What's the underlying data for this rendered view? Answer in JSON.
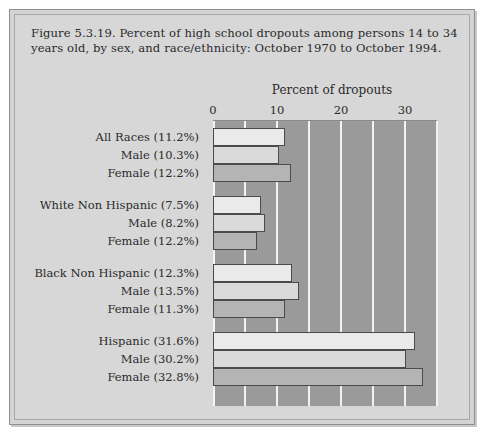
{
  "figure": {
    "caption": "Figure 5.3.19. Percent of high school dropouts among persons 14 to 34 years old, by sex, and race/ethnicity: October 1970 to October 1994."
  },
  "colors": {
    "page_background": "#ffffff",
    "panel_background": "#d7d7d7",
    "plot_background": "#9a9a9a",
    "gridline": "#f2f2f2",
    "bar_total": "#eaeaea",
    "bar_male": "#dadada",
    "bar_female": "#b4b4b4",
    "bar_outline": "#4b4b4b",
    "text": "#2a2a2a"
  },
  "chart_data": {
    "type": "bar",
    "orientation": "horizontal",
    "title": "Figure 5.3.19. Percent of high school dropouts among persons 14 to 34 years old, by sex, and race/ethnicity: October 1970 to October 1994.",
    "xlabel": "Percent of dropouts",
    "ylabel": "",
    "xlim": [
      0,
      35
    ],
    "xticks": [
      0,
      10,
      20,
      30
    ],
    "xtick_labels": [
      "0",
      "10",
      "20",
      "30"
    ],
    "minor_xticks": [
      5,
      15,
      25,
      35
    ],
    "grid": "vertical gridlines at every 5 percent",
    "legend": "none",
    "units": "percent",
    "groups": [
      {
        "name": "All Races",
        "series": "total",
        "rows": [
          {
            "label": "All Races (11.2%)",
            "series": "total",
            "value": 11.2,
            "plotted": 11.2
          },
          {
            "label": "Male (10.3%)",
            "series": "male",
            "value": 10.3,
            "plotted": 10.3
          },
          {
            "label": "Female (12.2%)",
            "series": "female",
            "value": 12.2,
            "plotted": 12.2
          }
        ]
      },
      {
        "name": "White Non Hispanic",
        "series": "total",
        "rows": [
          {
            "label": "White Non Hispanic (7.5%)",
            "series": "total",
            "value": 7.5,
            "plotted": 7.5
          },
          {
            "label": "Male (8.2%)",
            "series": "male",
            "value": 8.2,
            "plotted": 8.2
          },
          {
            "label": "Female (12.2%)",
            "series": "female",
            "value": 12.2,
            "plotted": 6.8
          }
        ]
      },
      {
        "name": "Black Non Hispanic",
        "series": "total",
        "rows": [
          {
            "label": "Black Non Hispanic (12.3%)",
            "series": "total",
            "value": 12.3,
            "plotted": 12.3
          },
          {
            "label": "Male (13.5%)",
            "series": "male",
            "value": 13.5,
            "plotted": 13.5
          },
          {
            "label": "Female (11.3%)",
            "series": "female",
            "value": 11.3,
            "plotted": 11.3
          }
        ]
      },
      {
        "name": "Hispanic",
        "series": "total",
        "rows": [
          {
            "label": "Hispanic (31.6%)",
            "series": "total",
            "value": 31.6,
            "plotted": 31.6
          },
          {
            "label": "Male (30.2%)",
            "series": "male",
            "value": 30.2,
            "plotted": 30.2
          },
          {
            "label": "Female (32.8%)",
            "series": "female",
            "value": 32.8,
            "plotted": 32.8
          }
        ]
      }
    ]
  }
}
